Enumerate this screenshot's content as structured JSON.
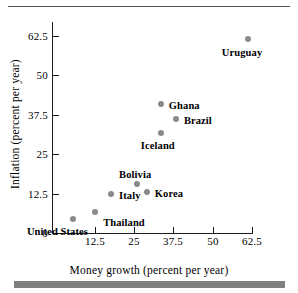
{
  "figure": {
    "has_top_rule": true,
    "has_bottom_bar": true,
    "bar_color": "#808080",
    "marker_color": "#8a8a8a"
  },
  "chart_data": {
    "type": "scatter",
    "title": "",
    "xlabel": "Money growth (percent per year)",
    "ylabel": "Inflation (percent per year)",
    "xlim": [
      0,
      68
    ],
    "ylim": [
      0,
      68
    ],
    "xticks": [
      12.5,
      25,
      37.5,
      50,
      62.5
    ],
    "xtick_labels": [
      "12.5",
      "25",
      "37.5",
      "50",
      "62.5"
    ],
    "yticks": [
      0,
      12.5,
      25,
      37.5,
      50,
      62.5
    ],
    "ytick_labels": [
      "0",
      "12.5",
      "25",
      "37.5",
      "50",
      "62.5"
    ],
    "grid": false,
    "legend": "none",
    "points": [
      {
        "label": "United States",
        "x": 5.4,
        "y": 4.5,
        "label_dx": -46,
        "label_dy": 7
      },
      {
        "label": "Thailand",
        "x": 12.5,
        "y": 6.5,
        "label_dx": 8,
        "label_dy": 5
      },
      {
        "label": "Italy",
        "x": 17.6,
        "y": 12.5,
        "label_dx": 8,
        "label_dy": -4
      },
      {
        "label": "Bolivia",
        "x": 25.9,
        "y": 15.6,
        "label_dx": -18,
        "label_dy": -15
      },
      {
        "label": "Korea",
        "x": 29.0,
        "y": 13.1,
        "label_dx": 8,
        "label_dy": -4
      },
      {
        "label": "Iceland",
        "x": 33.5,
        "y": 31.8,
        "label_dx": -20,
        "label_dy": 7
      },
      {
        "label": "Ghana",
        "x": 33.5,
        "y": 41.0,
        "label_dx": 8,
        "label_dy": -4
      },
      {
        "label": "Brazil",
        "x": 38.3,
        "y": 36.2,
        "label_dx": 8,
        "label_dy": -4
      },
      {
        "label": "Uruguay",
        "x": 61.3,
        "y": 61.6,
        "label_dx": -26,
        "label_dy": 8
      }
    ]
  }
}
